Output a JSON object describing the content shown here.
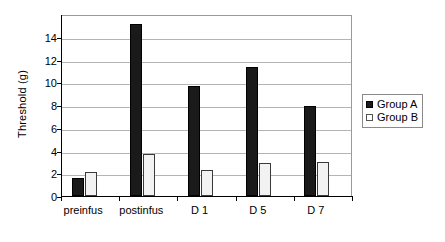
{
  "chart_data": {
    "type": "bar",
    "title": "",
    "subtitle": "",
    "xlabel": "",
    "ylabel": "Threshold (g)",
    "categories": [
      "preinfus",
      "postinfus",
      "D 1",
      "D 5",
      "D 7"
    ],
    "series": [
      {
        "name": "Group A",
        "color": "#1a1a1a",
        "values": [
          1.6,
          15.1,
          9.7,
          11.3,
          7.9
        ]
      },
      {
        "name": "Group B",
        "color": "#f2f2f2",
        "values": [
          2.1,
          3.7,
          2.3,
          2.9,
          3.0
        ]
      }
    ],
    "ylim": [
      0,
      16
    ],
    "yticks": [
      0,
      2,
      4,
      6,
      8,
      10,
      12,
      14
    ],
    "ytick_labels": [
      "0",
      "2",
      "4",
      "6",
      "8",
      "10",
      "12",
      "14"
    ],
    "grid": true,
    "grid_axis": "y",
    "legend_position": "right",
    "legend_entries": [
      "Group A",
      "Group B"
    ],
    "annotations": []
  },
  "legend": {
    "items": [
      {
        "label": "Group A",
        "swatch": "filled-square-icon"
      },
      {
        "label": "Group B",
        "swatch": "open-square-icon"
      }
    ]
  }
}
